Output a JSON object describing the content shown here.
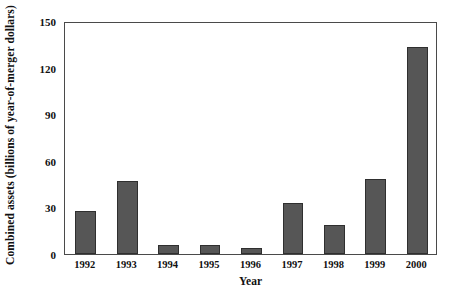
{
  "chart_data": {
    "type": "bar",
    "title": "",
    "subtitle": "",
    "xlabel": "Year",
    "ylabel": "Combined assets (billions of year-of-merger dollars)",
    "categories": [
      "1992",
      "1993",
      "1994",
      "1995",
      "1996",
      "1997",
      "1998",
      "1999",
      "2000"
    ],
    "values": [
      28,
      47,
      6,
      6,
      4,
      33,
      19,
      48,
      133
    ],
    "series": [
      {
        "name": "Combined assets",
        "values": [
          28,
          47,
          6,
          6,
          4,
          33,
          19,
          48,
          133
        ]
      }
    ],
    "ylim": [
      0,
      150
    ],
    "ytick_labels": [
      "0",
      "30",
      "60",
      "90",
      "120",
      "150"
    ],
    "ytick_values": [
      0,
      30,
      60,
      90,
      120,
      150
    ],
    "grid": false,
    "legend": false,
    "legend_position": "none",
    "annotations": [],
    "colors": {
      "bar_fill": "#565656",
      "bar_border": "#2f2f2f",
      "axis": "#4a4a4a",
      "text": "#111111",
      "background": "#ffffff"
    }
  }
}
